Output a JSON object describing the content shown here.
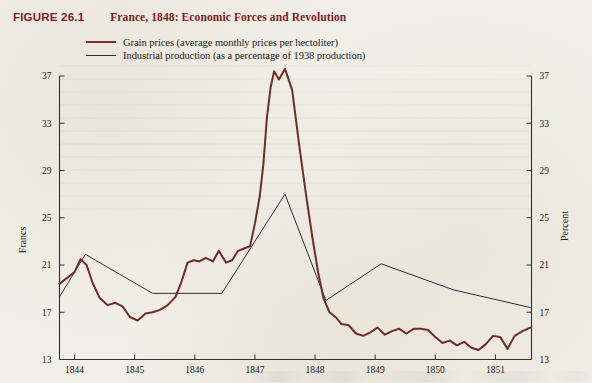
{
  "figure": {
    "number": "FIGURE 26.1",
    "title": "France, 1848: Economic Forces and Revolution"
  },
  "legend": {
    "items": [
      {
        "label": "Grain prices (average monthly prices per hectoliter)",
        "color": "#6f2d26",
        "key": "grain"
      },
      {
        "label": "Industrial production (as a percentage of 1938 production)",
        "color": "#2c2c3a",
        "key": "industrial"
      }
    ]
  },
  "axes": {
    "left_title": "Francs",
    "right_title": "Percent",
    "y_ticks": [
      "13",
      "17",
      "21",
      "25",
      "29",
      "33",
      "37"
    ],
    "x_ticks": [
      "1844",
      "1845",
      "1846",
      "1847",
      "1848",
      "1849",
      "1850",
      "1851"
    ]
  },
  "colors": {
    "grain": "#6f2d26",
    "industrial": "#2c2c3a",
    "heading": "#7c1d22",
    "paper": "#f2efe8",
    "axis": "#33302c"
  },
  "chart_data": {
    "type": "line",
    "title": "France, 1848: Economic Forces and Revolution",
    "xlabel": "",
    "ylabel": "Francs",
    "y2label": "Percent",
    "xlim": [
      1843.75,
      1851.6
    ],
    "ylim": [
      13,
      37
    ],
    "y2lim": [
      13,
      37
    ],
    "grid": false,
    "legend_position": "top-left",
    "x_tick_values": [
      1844,
      1845,
      1846,
      1847,
      1848,
      1849,
      1850,
      1851
    ],
    "y_tick_values": [
      13,
      17,
      21,
      25,
      29,
      33,
      37
    ],
    "series": [
      {
        "name": "Grain prices (average monthly prices per hectoliter)",
        "axis": "left",
        "units": "francs per hectoliter",
        "color": "#6f2d26",
        "x": [
          1843.75,
          1843.9,
          1844.0,
          1844.1,
          1844.2,
          1844.3,
          1844.42,
          1844.55,
          1844.68,
          1844.8,
          1844.92,
          1845.05,
          1845.18,
          1845.3,
          1845.42,
          1845.55,
          1845.68,
          1845.78,
          1845.88,
          1845.98,
          1846.08,
          1846.18,
          1846.3,
          1846.4,
          1846.52,
          1846.62,
          1846.72,
          1846.82,
          1846.92,
          1847.0,
          1847.08,
          1847.14,
          1847.2,
          1847.26,
          1847.32,
          1847.4,
          1847.5,
          1847.62,
          1847.74,
          1847.86,
          1847.96,
          1848.05,
          1848.14,
          1848.24,
          1848.34,
          1848.44,
          1848.56,
          1848.68,
          1848.8,
          1848.92,
          1849.04,
          1849.16,
          1849.28,
          1849.4,
          1849.52,
          1849.64,
          1849.76,
          1849.88,
          1850.0,
          1850.12,
          1850.24,
          1850.36,
          1850.48,
          1850.6,
          1850.72,
          1850.84,
          1850.96,
          1851.08,
          1851.2,
          1851.32,
          1851.45,
          1851.58
        ],
        "y": [
          19.4,
          20.0,
          20.4,
          21.5,
          21.0,
          19.5,
          18.2,
          17.6,
          17.8,
          17.5,
          16.6,
          16.3,
          16.9,
          17.0,
          17.2,
          17.6,
          18.3,
          19.6,
          21.2,
          21.4,
          21.3,
          21.6,
          21.3,
          22.2,
          21.2,
          21.4,
          22.2,
          22.4,
          22.6,
          24.5,
          26.8,
          29.5,
          33.5,
          36.0,
          37.4,
          36.7,
          37.6,
          35.8,
          31.0,
          26.6,
          23.2,
          20.4,
          18.2,
          17.0,
          16.6,
          16.0,
          15.9,
          15.2,
          15.0,
          15.3,
          15.7,
          15.1,
          15.4,
          15.6,
          15.2,
          15.6,
          15.6,
          15.5,
          14.9,
          14.4,
          14.6,
          14.2,
          14.5,
          14.0,
          13.8,
          14.3,
          15.0,
          14.9,
          13.9,
          15.0,
          15.4,
          15.7
        ]
      },
      {
        "name": "Industrial production (as a percentage of 1938 production)",
        "axis": "right",
        "units": "percent of 1938 production",
        "color": "#2c2c3a",
        "x": [
          1843.75,
          1844.18,
          1845.3,
          1846.45,
          1847.5,
          1848.18,
          1849.1,
          1850.3,
          1851.58
        ],
        "y": [
          18.3,
          21.9,
          18.6,
          18.6,
          27.0,
          18.0,
          21.1,
          18.9,
          17.4
        ]
      }
    ],
    "annotations": []
  }
}
